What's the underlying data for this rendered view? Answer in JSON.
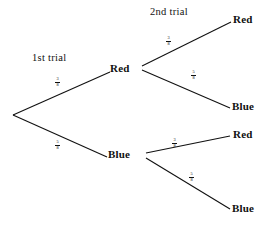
{
  "diagram": {
    "type": "probability-tree",
    "title": "",
    "stage_labels": [
      {
        "id": "stage1",
        "text": "1st trial"
      },
      {
        "id": "stage2",
        "text": "2nd trial"
      }
    ],
    "nodes": [
      {
        "id": "root",
        "label": "",
        "x": 12,
        "y": 115
      },
      {
        "id": "red1",
        "label": "Red",
        "x": 118,
        "y": 73
      },
      {
        "id": "blue1",
        "label": "Blue",
        "x": 118,
        "y": 158
      },
      {
        "id": "red-red",
        "label": "Red",
        "x": 238,
        "y": 22
      },
      {
        "id": "red-blue",
        "label": "Blue",
        "x": 238,
        "y": 108
      },
      {
        "id": "blue-red",
        "label": "Red",
        "x": 238,
        "y": 138
      },
      {
        "id": "blue-blue",
        "label": "Blue",
        "x": 238,
        "y": 212
      }
    ],
    "branches": [
      {
        "id": "root-red1",
        "from": "root",
        "to": "red1",
        "numerator": "3",
        "denominator": "8"
      },
      {
        "id": "root-blue1",
        "from": "root",
        "to": "blue1",
        "numerator": "5",
        "denominator": "8"
      },
      {
        "id": "red1-red",
        "from": "red1",
        "to": "red-red",
        "numerator": "3",
        "denominator": "8"
      },
      {
        "id": "red1-blue",
        "from": "red1",
        "to": "red-blue",
        "numerator": "5",
        "denominator": "8"
      },
      {
        "id": "blue1-red",
        "from": "blue1",
        "to": "blue-red",
        "numerator": "3",
        "denominator": "8"
      },
      {
        "id": "blue1-blue",
        "from": "blue1",
        "to": "blue-blue",
        "numerator": "5",
        "denominator": "8"
      }
    ],
    "colors": {
      "line": "#111111",
      "text": "#111111",
      "background": "#ffffff"
    }
  }
}
